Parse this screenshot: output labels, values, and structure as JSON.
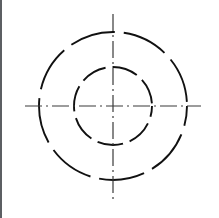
{
  "drawing": {
    "title": "Concentric Hidden-Line Circles with Centerlines",
    "background_color": "#ffffff",
    "line_color": "#111111",
    "centerline_color": "#3a3a3a",
    "border_color": "#5c5f63",
    "canvas": {
      "width": 219,
      "height": 218
    },
    "center": {
      "x": 113,
      "y": 106
    },
    "circles": [
      {
        "name": "outer-circle",
        "radius": 74,
        "diameter": 148,
        "stroke_width": 1.9,
        "style": "hidden-dashed",
        "dash_pattern": "46 9",
        "dash_offset": 26
      },
      {
        "name": "inner-circle",
        "radius": 39,
        "diameter": 78,
        "stroke_width": 1.9,
        "style": "hidden-dashed",
        "dash_pattern": "26 7",
        "dash_offset": 15
      }
    ],
    "centerlines": [
      {
        "name": "horizontal-centerline",
        "orientation": "horizontal",
        "x1": 25,
        "y1": 106,
        "x2": 201,
        "y2": 106,
        "stroke_width": 1.2,
        "style": "dash-dot",
        "dash_pattern": "17 4 2 4"
      },
      {
        "name": "vertical-centerline",
        "orientation": "vertical",
        "x1": 113,
        "y1": 14,
        "x2": 113,
        "y2": 203,
        "stroke_width": 1.2,
        "style": "dash-dot",
        "dash_pattern": "17 4 2 4"
      }
    ],
    "labels": {
      "figure_caption": "",
      "dimension_text": ""
    }
  }
}
